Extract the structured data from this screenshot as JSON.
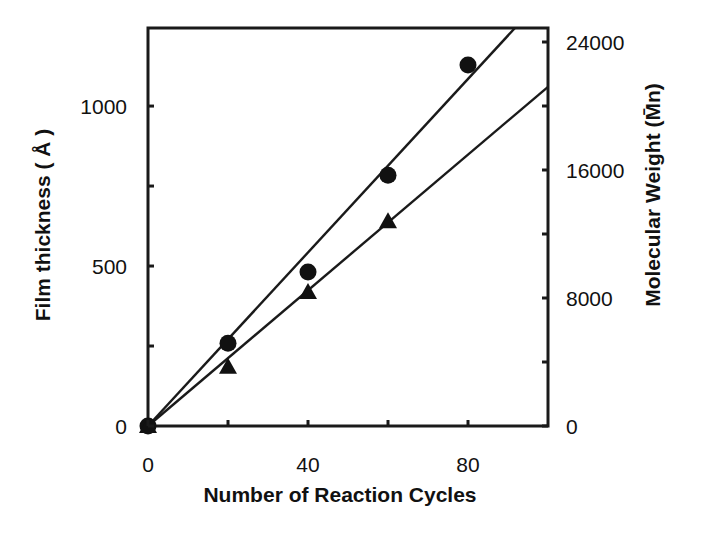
{
  "chart_data": {
    "type": "scatter",
    "title": "",
    "xlabel": "Number of Reaction Cycles",
    "ylabel": "Film thickness ( Å )",
    "y2label": "Molecular Weight (M̄n)",
    "xlim": [
      0,
      100
    ],
    "ylim": [
      0,
      1244
    ],
    "y2lim": [
      0,
      24875
    ],
    "grid": false,
    "legend": null,
    "x_ticks": [
      0,
      40,
      80
    ],
    "x_minor_ticks": [
      20,
      60
    ],
    "y_ticks": [
      0,
      500,
      1000
    ],
    "y_minor_ticks": [
      250,
      750
    ],
    "y2_ticks": [
      0,
      8000,
      16000,
      24000
    ],
    "y2_minor_ticks": [
      4000,
      12000,
      20000
    ],
    "series": [
      {
        "name": "Film thickness",
        "axis": "left",
        "marker": "circle",
        "x": [
          0,
          20,
          40,
          60,
          80
        ],
        "values": [
          0,
          259,
          481,
          784,
          1128
        ],
        "fit_line": {
          "slope": 13.56,
          "intercept": 0
        }
      },
      {
        "name": "Molecular Weight (Mn)",
        "axis": "right",
        "marker": "triangle",
        "x": [
          0,
          20,
          40,
          60
        ],
        "values": [
          0,
          3700,
          8375,
          12800
        ],
        "fit_line": {
          "slope": 212,
          "intercept": 0
        }
      }
    ]
  }
}
